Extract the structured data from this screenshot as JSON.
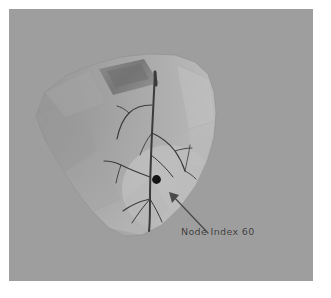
{
  "figure": {
    "kind": "3d-cardiac-mesh-render",
    "background_color": "#9e9e9e",
    "page_color": "#ffffff",
    "canvas": {
      "x": 9,
      "y": 9,
      "width": 304,
      "height": 272
    }
  },
  "annotation": {
    "label": "Node Index 60",
    "label_color": "#3a3a3a",
    "label_x": 181,
    "label_y": 226,
    "node_marker": {
      "name": "selected-node-marker",
      "color": "#141414",
      "radius": 4.2,
      "x": 156.5,
      "y": 179.5
    },
    "arrow": {
      "name": "annotation-arrow",
      "color": "#4a4a4a",
      "from_x": 199,
      "from_y": 224,
      "to_x": 161,
      "to_y": 184
    }
  },
  "mesh": {
    "name": "heart-surface-mesh",
    "body_color": "#b4b4b4",
    "shadow_color": "#8e8e8e",
    "highlight_color": "#c9c9c9",
    "outline_color": "#8a8a8a",
    "patch": {
      "name": "activation-patch",
      "color": "#b9b9b9",
      "cx": 160,
      "cy": 180,
      "rx": 47,
      "ry": 44
    },
    "notch": {
      "name": "atrial-appendage-notch",
      "color": "#7d7d7d"
    }
  },
  "tree": {
    "name": "purkinje-conduction-tree",
    "color": "#3b3b3b",
    "trunk_width": 2.0,
    "branch_width": 1.1,
    "description": "Branching conduction fiber network over the ventricular surface"
  },
  "colors": {
    "background": "#9e9e9e",
    "mesh_body": "#b4b4b4",
    "mesh_shadow": "#8e8e8e",
    "tree": "#3b3b3b",
    "node": "#141414",
    "text": "#3a3a3a"
  }
}
